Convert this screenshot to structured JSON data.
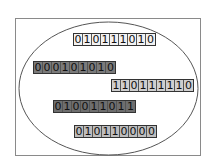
{
  "diagram": {
    "type": "set-of-bitstrings",
    "container": "ellipse",
    "bitstrings": [
      {
        "value": "010111010",
        "fill": "#f2f2f2",
        "x": 73,
        "y": 33
      },
      {
        "value": "000101010",
        "fill": "#7a7a7a",
        "x": 33,
        "y": 61
      },
      {
        "value": "110111110",
        "fill": "#cfcfcf",
        "x": 111,
        "y": 79
      },
      {
        "value": "010011011",
        "fill": "#6e6e6e",
        "x": 53,
        "y": 100
      },
      {
        "value": "010110000",
        "fill": "#bdbdbd",
        "x": 74,
        "y": 125
      }
    ]
  }
}
